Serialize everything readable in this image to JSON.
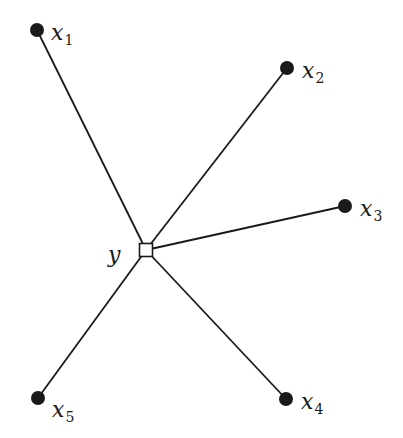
{
  "diagram": {
    "type": "star-graph",
    "center": {
      "id": "y",
      "label": "y",
      "shape": "square",
      "x": 146,
      "y": 250,
      "size": 13,
      "label_x": 108,
      "label_y": 262
    },
    "nodes": [
      {
        "id": "x1",
        "label": "x",
        "subscript": "1",
        "x": 37,
        "y": 30,
        "label_x": 51,
        "label_y": 40
      },
      {
        "id": "x2",
        "label": "x",
        "subscript": "2",
        "x": 287,
        "y": 68,
        "label_x": 302,
        "label_y": 78
      },
      {
        "id": "x3",
        "label": "x",
        "subscript": "3",
        "x": 345,
        "y": 206,
        "label_x": 360,
        "label_y": 216
      },
      {
        "id": "x4",
        "label": "x",
        "subscript": "4",
        "x": 286,
        "y": 399,
        "label_x": 301,
        "label_y": 409
      },
      {
        "id": "x5",
        "label": "x",
        "subscript": "5",
        "x": 38,
        "y": 398,
        "label_x": 52,
        "label_y": 417
      }
    ],
    "edges": [
      {
        "from": "y",
        "to": "x1"
      },
      {
        "from": "y",
        "to": "x2"
      },
      {
        "from": "y",
        "to": "x3"
      },
      {
        "from": "y",
        "to": "x4"
      },
      {
        "from": "y",
        "to": "x5"
      }
    ],
    "colors": {
      "ink": "#1a1a1a",
      "background": "#ffffff"
    }
  }
}
